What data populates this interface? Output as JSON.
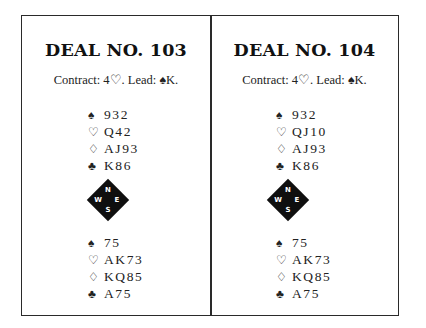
{
  "deals": [
    {
      "title": "DEAL NO. 103",
      "contract": "Contract: 4♡. Lead: ♠K.",
      "north": [
        {
          "suit": "♠",
          "suit_name": "spades",
          "cards": "932"
        },
        {
          "suit": "♡",
          "suit_name": "hearts",
          "cards": "Q42"
        },
        {
          "suit": "♢",
          "suit_name": "diamonds",
          "cards": "AJ93"
        },
        {
          "suit": "♣",
          "suit_name": "clubs",
          "cards": "K86"
        }
      ],
      "compass": {
        "n": "N",
        "e": "E",
        "s": "S",
        "w": "W"
      },
      "south": [
        {
          "suit": "♠",
          "suit_name": "spades",
          "cards": "75"
        },
        {
          "suit": "♡",
          "suit_name": "hearts",
          "cards": "AK73"
        },
        {
          "suit": "♢",
          "suit_name": "diamonds",
          "cards": "KQ85"
        },
        {
          "suit": "♣",
          "suit_name": "clubs",
          "cards": "A75"
        }
      ]
    },
    {
      "title": "DEAL NO. 104",
      "contract": "Contract: 4♡. Lead: ♠K.",
      "north": [
        {
          "suit": "♠",
          "suit_name": "spades",
          "cards": "932"
        },
        {
          "suit": "♡",
          "suit_name": "hearts",
          "cards": "QJ10"
        },
        {
          "suit": "♢",
          "suit_name": "diamonds",
          "cards": "AJ93"
        },
        {
          "suit": "♣",
          "suit_name": "clubs",
          "cards": "K86"
        }
      ],
      "compass": {
        "n": "N",
        "e": "E",
        "s": "S",
        "w": "W"
      },
      "south": [
        {
          "suit": "♠",
          "suit_name": "spades",
          "cards": "75"
        },
        {
          "suit": "♡",
          "suit_name": "hearts",
          "cards": "AK73"
        },
        {
          "suit": "♢",
          "suit_name": "diamonds",
          "cards": "KQ85"
        },
        {
          "suit": "♣",
          "suit_name": "clubs",
          "cards": "A75"
        }
      ]
    }
  ],
  "colors": {
    "ink": "#111111",
    "border": "#2a2a2a",
    "background": "#ffffff"
  }
}
